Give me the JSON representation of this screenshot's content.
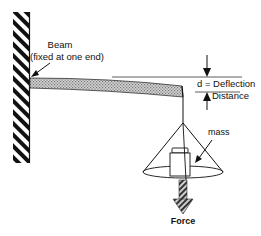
{
  "diagram": {
    "type": "cantilever-beam-deflection",
    "labels": {
      "beam_line1": "Beam",
      "beam_line2": "(fixed at one end)",
      "deflection_line1": "d = Deflection",
      "deflection_line2": "Distance",
      "mass": "mass",
      "force": "Force"
    },
    "colors": {
      "ink": "#111111",
      "beam_fill": "#b8b8b8",
      "background": "#ffffff"
    },
    "components": [
      "wall",
      "beam",
      "dimension-lines",
      "deflection-arrows",
      "string",
      "cone-pan",
      "mass-block",
      "force-arrow"
    ]
  }
}
